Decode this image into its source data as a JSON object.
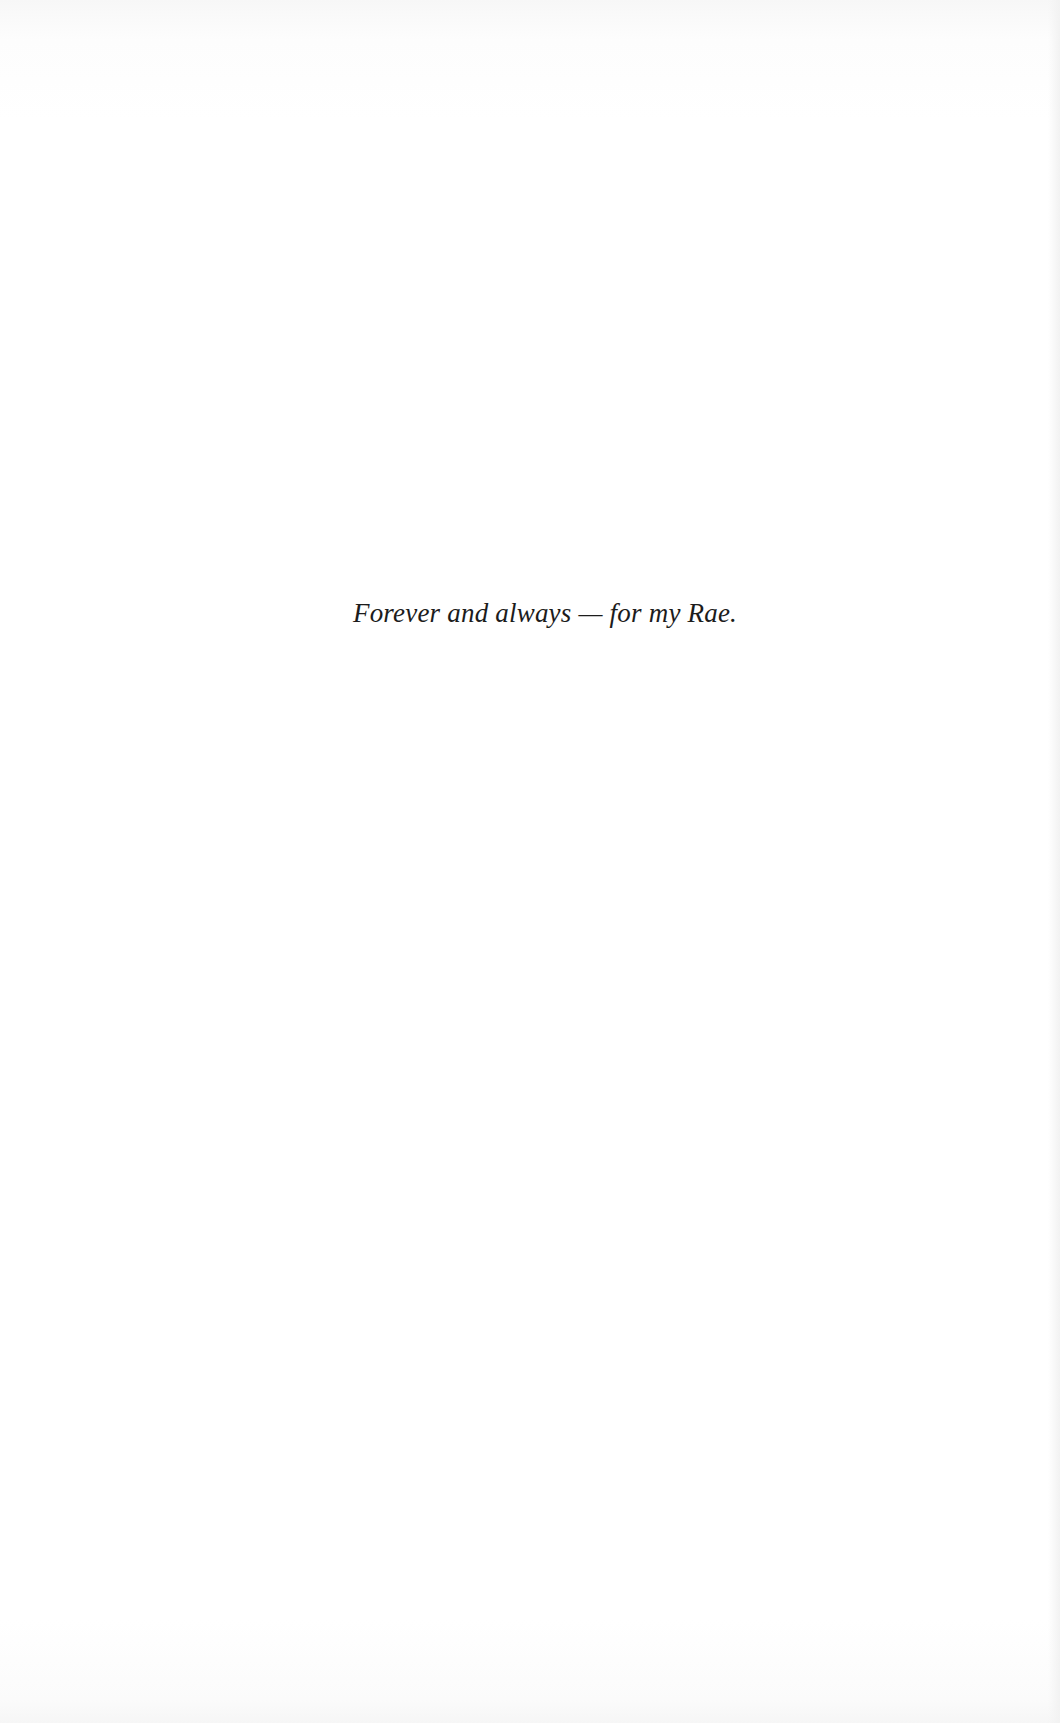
{
  "page": {
    "type": "dedication",
    "dedication_text": "Forever and always — for my Rae."
  }
}
